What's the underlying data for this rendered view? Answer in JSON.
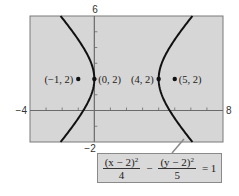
{
  "chart_data": {
    "type": "line",
    "title": "",
    "xlabel": "",
    "ylabel": "",
    "xlim": [
      -4,
      8
    ],
    "ylim": [
      -2,
      6
    ],
    "grid": false,
    "xtick_labels": {
      "min": "−4",
      "max": "8"
    },
    "ytick_labels": {
      "min": "−2",
      "max": "6"
    },
    "equation": {
      "term1_num": "(x − 2)",
      "term1_exp": "2",
      "term1_den": "4",
      "minus": "−",
      "term2_num": "(y − 2)",
      "term2_exp": "2",
      "term2_den": "5",
      "rhs": "= 1"
    },
    "hyperbola": {
      "h": 2,
      "k": 2,
      "a": 2,
      "b_squared": 5
    },
    "points": [
      {
        "x": -1,
        "y": 2,
        "label": "(−1, 2)",
        "label_side": "left"
      },
      {
        "x": 0,
        "y": 2,
        "label": "(0, 2)",
        "label_side": "right"
      },
      {
        "x": 4,
        "y": 2,
        "label": "(4, 2)",
        "label_side": "left"
      },
      {
        "x": 5,
        "y": 2,
        "label": "(5, 2)",
        "label_side": "right"
      }
    ],
    "colors": {
      "plot_bg": "#d6d6d6",
      "frame": "#7a7a7a",
      "curve": "#111111",
      "axis": "#6a6a6a"
    }
  }
}
